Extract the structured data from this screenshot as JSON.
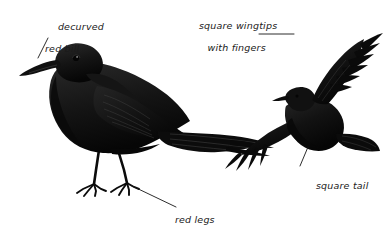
{
  "plate": {
    "width": 390,
    "height": 225,
    "background_color": "#ffffff",
    "ink_color": "#111111",
    "subject": "black chough field-guide plate",
    "figures": [
      {
        "name": "perched-bird",
        "pose": "perched, facing left"
      },
      {
        "name": "flying-bird",
        "pose": "in flight, wings spread, facing left"
      }
    ]
  },
  "annotations": {
    "bill": {
      "line1": "decurved",
      "line2": "red bill"
    },
    "wingtips": {
      "line1": "square wingtips",
      "line2": "with fingers"
    },
    "tail": {
      "line1": "square tail"
    },
    "legs": {
      "line1": "red legs"
    }
  },
  "leader_lines": [
    {
      "name": "leader-bill",
      "from": [
        48,
        38
      ],
      "to": [
        38,
        58
      ]
    },
    {
      "name": "leader-wingtips",
      "from": [
        259,
        34
      ],
      "to": [
        294,
        34
      ]
    },
    {
      "name": "leader-tail",
      "from": [
        308,
        147
      ],
      "to": [
        300,
        166
      ]
    },
    {
      "name": "leader-legs",
      "from": [
        130,
        185
      ],
      "to": [
        176,
        207
      ]
    }
  ]
}
